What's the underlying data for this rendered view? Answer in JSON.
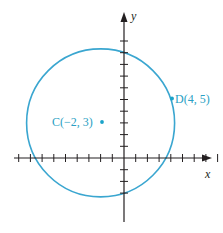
{
  "diagram": {
    "axes": {
      "x_label": "x",
      "y_label": "y",
      "origin_px": [
        124,
        158
      ],
      "unit_px": 11.7,
      "x_ticks": [
        -9,
        -8,
        -7,
        -6,
        -5,
        -4,
        -3,
        -2,
        -1,
        1,
        2,
        3,
        4,
        5,
        6,
        7,
        8,
        9
      ],
      "y_ticks": [
        -3,
        -2,
        -1,
        1,
        2,
        3,
        4,
        5,
        6,
        7,
        8,
        9,
        10
      ],
      "color": "#231f20"
    },
    "circle": {
      "center": [
        -2,
        3
      ],
      "radius_squared": 40,
      "color": "#3aa6d0"
    },
    "points": [
      {
        "name": "C",
        "coords": "(−2, 3)",
        "label": "C(−2, 3)",
        "x": -2,
        "y": 3
      },
      {
        "name": "D",
        "coords": "(4, 5)",
        "label": "D(4, 5)",
        "x": 4,
        "y": 5
      }
    ],
    "point_color": "#1aa3c9",
    "label_color": "#2a9fc4"
  }
}
